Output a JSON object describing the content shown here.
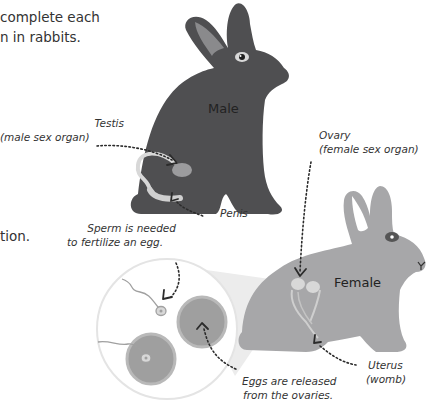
{
  "intro_text": {
    "line1": "complete each",
    "line2": "n in rabbits.",
    "line3": "tion."
  },
  "rabbits": {
    "male": {
      "label": "Male",
      "color": "#4f4f51",
      "ear_inner": "#8a8a8c"
    },
    "female": {
      "label": "Female",
      "color": "#a7a7a9",
      "ear_inner": "#ffffff"
    }
  },
  "labels": {
    "testis": {
      "line1": "Testis",
      "line2": "(male sex organ)"
    },
    "penis": {
      "line1": "Penis"
    },
    "ovary": {
      "line1": "Ovary",
      "line2": "(female sex organ)"
    },
    "sperm": {
      "line1": "Sperm is needed",
      "line2": "to fertilize an egg."
    },
    "uterus": {
      "line1": "Uterus",
      "line2": "(womb)"
    },
    "eggs": {
      "line1": "Eggs are released",
      "line2": "from the ovaries."
    }
  },
  "colors": {
    "organ_light": "#d8d8d8",
    "egg": "#9e9e9e",
    "zoom_circle_border": "#e6e6e6",
    "callout_cone": "#e9e9e9"
  }
}
